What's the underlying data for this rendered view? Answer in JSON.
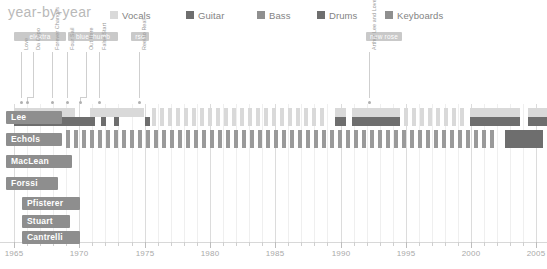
{
  "header": {
    "title": "year-by-year",
    "legend": [
      {
        "label": "Vocals",
        "color": "#d9d9d9",
        "x": 0
      },
      {
        "label": "Guitar",
        "color": "#6e6e6e",
        "x": 76
      },
      {
        "label": "Bass",
        "color": "#8f8f8f",
        "x": 147
      },
      {
        "label": "Drums",
        "color": "#6e6e6e",
        "x": 207
      },
      {
        "label": "Keyboards",
        "color": "#8f8f8f",
        "x": 275
      }
    ]
  },
  "eras": [
    {
      "label": "elektra",
      "x": 14,
      "w": 52
    },
    {
      "label": "blue thumb",
      "x": 68,
      "w": 50
    },
    {
      "label": "rso",
      "x": 131,
      "w": 18
    },
    {
      "label": "new rose",
      "x": 366,
      "w": 36
    }
  ],
  "annotations": [
    {
      "label": "Love",
      "x": 21,
      "tick_x": 21,
      "text_y": 50,
      "stem_top": 52,
      "stem_h": 46
    },
    {
      "label": "Da Capo",
      "x": 33,
      "tick_x": 27,
      "text_y": 50,
      "stem_top": 52,
      "stem_h": 46
    },
    {
      "label": "Forever Changes",
      "x": 52,
      "tick_x": 52,
      "text_y": 50,
      "stem_top": 52,
      "stem_h": 46
    },
    {
      "label": "Four Sail",
      "x": 67,
      "tick_x": 67,
      "text_y": 50,
      "stem_top": 52,
      "stem_h": 46
    },
    {
      "label": "Out Here",
      "x": 86,
      "tick_x": 80,
      "text_y": 50,
      "stem_top": 52,
      "stem_h": 46
    },
    {
      "label": "False Start",
      "x": 99,
      "tick_x": 99,
      "text_y": 50,
      "stem_top": 52,
      "stem_h": 46
    },
    {
      "label": "Reel to Real",
      "x": 139,
      "tick_x": 139,
      "text_y": 50,
      "stem_top": 52,
      "stem_h": 46
    },
    {
      "label": "Arthur Lee and Love",
      "x": 369,
      "tick_x": 369,
      "text_y": 50,
      "stem_top": 52,
      "stem_h": 46
    }
  ],
  "chart_data": {
    "type": "bar",
    "title": "year-by-year",
    "xlabel": "",
    "ylabel": "",
    "xlim": [
      1965,
      2005.5
    ],
    "grid": true,
    "legend_position": "top",
    "categories": [
      "Lee",
      "Echols",
      "MacLean",
      "Forssi",
      "Pfisterer",
      "Stuart",
      "Cantrelli"
    ],
    "xticks": [
      1965,
      1970,
      1975,
      1980,
      1985,
      1990,
      1995,
      2000,
      2005
    ],
    "series": [
      {
        "name": "Vocals",
        "color": "#d9d9d9"
      },
      {
        "name": "Guitar",
        "color": "#6e6e6e"
      },
      {
        "name": "Bass",
        "color": "#8f8f8f"
      },
      {
        "name": "Drums",
        "color": "#6e6e6e"
      },
      {
        "name": "Keyboards",
        "color": "#8f8f8f"
      }
    ],
    "rows": [
      {
        "name": "Lee",
        "label_x": 6,
        "label_w": 56,
        "y": 4,
        "h": 18,
        "bands": [
          {
            "instrument": "Vocals",
            "color": "#d9d9d9",
            "top": 0,
            "h": 9,
            "spans": [
              [
                14,
                75
              ],
              [
                90,
                144
              ],
              [
                335,
                346
              ],
              [
                352,
                400
              ],
              [
                470,
                520
              ],
              [
                528,
                547
              ]
            ]
          },
          {
            "instrument": "Guitar",
            "color": "#6e6e6e",
            "top": 9,
            "h": 9,
            "spans": [
              [
                14,
                95
              ],
              [
                101,
                106
              ],
              [
                114,
                119
              ],
              [
                145,
                150
              ],
              [
                335,
                346
              ],
              [
                352,
                400
              ],
              [
                470,
                520
              ],
              [
                528,
                547
              ]
            ]
          },
          {
            "instrument": "Vocals-ticks",
            "color": "#d9d9d9",
            "top": 0,
            "h": 18,
            "spans": [
              [
                152,
                156
              ],
              [
                160,
                164
              ],
              [
                168,
                172
              ],
              [
                176,
                180
              ],
              [
                184,
                188
              ],
              [
                192,
                196
              ],
              [
                200,
                204
              ],
              [
                208,
                212
              ],
              [
                216,
                220
              ],
              [
                224,
                228
              ],
              [
                232,
                236
              ],
              [
                240,
                244
              ],
              [
                248,
                252
              ],
              [
                256,
                260
              ],
              [
                264,
                268
              ],
              [
                272,
                276
              ],
              [
                280,
                284
              ],
              [
                288,
                292
              ],
              [
                296,
                300
              ],
              [
                304,
                308
              ],
              [
                312,
                316
              ],
              [
                320,
                324
              ],
              [
                404,
                408
              ],
              [
                412,
                416
              ],
              [
                420,
                424
              ],
              [
                428,
                432
              ],
              [
                436,
                440
              ],
              [
                444,
                448
              ],
              [
                452,
                456
              ],
              [
                460,
                464
              ]
            ]
          }
        ]
      },
      {
        "name": "Echols",
        "label_x": 6,
        "label_w": 56,
        "y": 26,
        "h": 18,
        "bands": [
          {
            "instrument": "Guitar",
            "color": "#9a9a9a",
            "top": 0,
            "h": 18,
            "spans": [
              [
                66,
                70
              ],
              [
                74,
                78
              ],
              [
                82,
                86
              ],
              [
                90,
                94
              ],
              [
                98,
                102
              ],
              [
                106,
                110
              ],
              [
                114,
                118
              ],
              [
                122,
                126
              ],
              [
                130,
                134
              ],
              [
                138,
                142
              ],
              [
                146,
                150
              ],
              [
                154,
                158
              ],
              [
                162,
                166
              ],
              [
                170,
                174
              ],
              [
                178,
                182
              ],
              [
                186,
                190
              ],
              [
                194,
                198
              ],
              [
                202,
                206
              ],
              [
                210,
                214
              ],
              [
                218,
                222
              ],
              [
                226,
                230
              ],
              [
                234,
                238
              ],
              [
                242,
                246
              ],
              [
                250,
                254
              ],
              [
                258,
                262
              ],
              [
                266,
                270
              ],
              [
                274,
                278
              ],
              [
                282,
                286
              ],
              [
                290,
                294
              ],
              [
                298,
                302
              ],
              [
                306,
                310
              ],
              [
                314,
                318
              ],
              [
                322,
                326
              ],
              [
                330,
                334
              ],
              [
                338,
                342
              ],
              [
                346,
                350
              ],
              [
                354,
                358
              ],
              [
                362,
                366
              ],
              [
                370,
                374
              ],
              [
                378,
                382
              ],
              [
                386,
                390
              ],
              [
                394,
                398
              ],
              [
                402,
                406
              ],
              [
                410,
                414
              ],
              [
                418,
                422
              ],
              [
                426,
                430
              ],
              [
                434,
                438
              ],
              [
                442,
                446
              ],
              [
                450,
                454
              ],
              [
                458,
                462
              ],
              [
                466,
                470
              ],
              [
                474,
                478
              ],
              [
                482,
                486
              ],
              [
                490,
                494
              ]
            ]
          },
          {
            "instrument": "Guitar",
            "color": "#6e6e6e",
            "top": 0,
            "h": 18,
            "spans": [
              [
                505,
                543
              ]
            ]
          }
        ]
      },
      {
        "name": "MacLean",
        "label_x": 6,
        "label_w": 66,
        "y": 48,
        "h": 18,
        "bands": []
      },
      {
        "name": "Forssi",
        "label_x": 6,
        "label_w": 52,
        "y": 70,
        "h": 18,
        "bands": []
      },
      {
        "name": "Pfisterer",
        "label_x": 22,
        "label_w": 58,
        "y": 90,
        "h": 18,
        "bands": []
      },
      {
        "name": "Stuart",
        "label_x": 22,
        "label_w": 48,
        "y": 108,
        "h": 18,
        "bands": []
      },
      {
        "name": "Cantrelli",
        "label_x": 22,
        "label_w": 58,
        "y": 124,
        "h": 18,
        "bands": []
      }
    ]
  },
  "axis": {
    "labels": [
      "1965",
      "1970",
      "1975",
      "1980",
      "1985",
      "1990",
      "1995",
      "2000",
      "2005"
    ]
  }
}
